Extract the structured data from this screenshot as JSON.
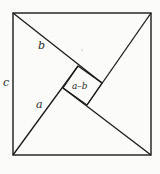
{
  "diagram": {
    "type": "pythagorean-proof-square",
    "colors": {
      "stroke": "#1a1a1a",
      "background": "#fbfbf9",
      "label": "#2a2a2a"
    },
    "outer_square": {
      "x1": 13,
      "y1": 13,
      "x2": 151,
      "y2": 155
    },
    "inner_square": {
      "points": [
        [
          78,
          66
        ],
        [
          102,
          83
        ],
        [
          87,
          105
        ],
        [
          63,
          88
        ]
      ]
    },
    "labels": {
      "side_c": "c",
      "leg_b": "b",
      "leg_a": "a",
      "inner": "a–b"
    }
  }
}
